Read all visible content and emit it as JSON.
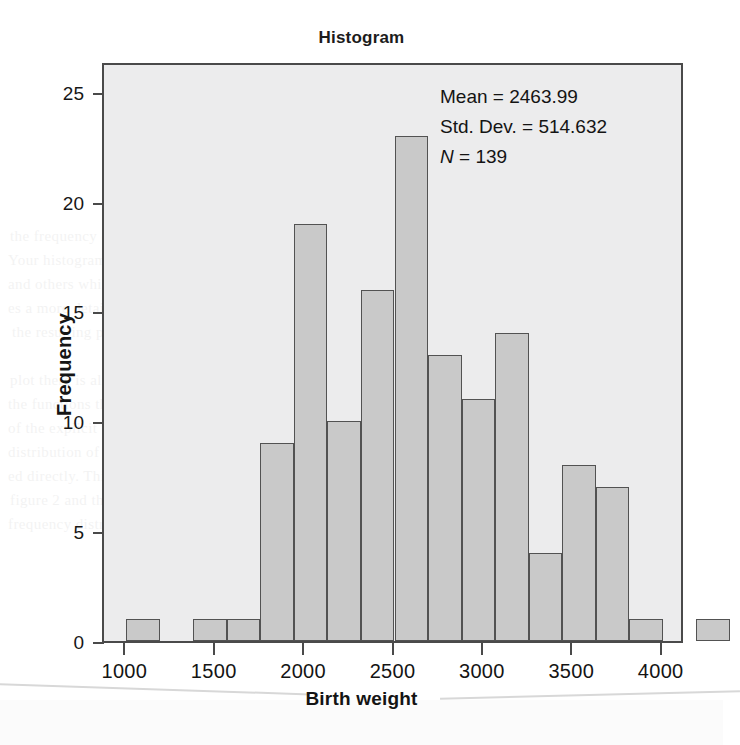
{
  "chart_data": {
    "type": "bar",
    "title": "Histogram",
    "xlabel": "Birth weight",
    "ylabel": "Frequency",
    "grid": false,
    "legend": null,
    "xlim": [
      875,
      4125
    ],
    "ylim": [
      0,
      26.4
    ],
    "xticks": [
      1000,
      1500,
      2000,
      2500,
      3000,
      3500,
      4000
    ],
    "yticks": [
      0,
      5,
      10,
      15,
      20,
      25
    ],
    "bin_width": 187.5,
    "bins": [
      {
        "x_left": 1000,
        "x_right": 1187.5,
        "value": 1
      },
      {
        "x_left": 1375,
        "x_right": 1562.5,
        "value": 1
      },
      {
        "x_left": 1562.5,
        "x_right": 1750,
        "value": 1
      },
      {
        "x_left": 1750,
        "x_right": 1937.5,
        "value": 9
      },
      {
        "x_left": 1937.5,
        "x_right": 2125,
        "value": 19
      },
      {
        "x_left": 2125,
        "x_right": 2312.5,
        "value": 10
      },
      {
        "x_left": 2312.5,
        "x_right": 2500,
        "value": 16
      },
      {
        "x_left": 2500,
        "x_right": 2687.5,
        "value": 23
      },
      {
        "x_left": 2687.5,
        "x_right": 2875,
        "value": 13
      },
      {
        "x_left": 2875,
        "x_right": 3062.5,
        "value": 11
      },
      {
        "x_left": 3062.5,
        "x_right": 3250,
        "value": 14
      },
      {
        "x_left": 3250,
        "x_right": 3437.5,
        "value": 4
      },
      {
        "x_left": 3437.5,
        "x_right": 3625,
        "value": 8
      },
      {
        "x_left": 3625,
        "x_right": 3812.5,
        "value": 7
      },
      {
        "x_left": 3812.5,
        "x_right": 4000,
        "value": 1
      },
      {
        "x_left": 4187.5,
        "x_right": 4375,
        "value": 1
      }
    ],
    "categories": [
      "1000",
      "1375",
      "1563",
      "1750",
      "1938",
      "2125",
      "2313",
      "2500",
      "2688",
      "2875",
      "3063",
      "3250",
      "3438",
      "3625",
      "3813",
      "4188"
    ],
    "values": [
      1,
      1,
      1,
      9,
      19,
      10,
      16,
      23,
      13,
      11,
      14,
      4,
      8,
      7,
      1,
      1
    ],
    "bar_fill": "#c9c9c9",
    "bar_stroke": "#525252",
    "plot_background": "#ececed"
  },
  "annotations": {
    "mean_label": "Mean = 2463.99",
    "stddev_label": "Std. Dev. = 514.632",
    "n_symbol": "N",
    "n_value": " = 139",
    "mean": 2463.99,
    "std_dev": 514.632,
    "n": 139
  },
  "bleed_text": {
    "lines": [
      {
        "text": "in data separately as result",
        "x": 200,
        "y": 78,
        "size": 15
      },
      {
        "text": "ing arms and plots",
        "x": 215,
        "y": 192,
        "size": 19,
        "head": true
      },
      {
        "text": "the frequency distribution of the",
        "x": 10,
        "y": 228,
        "size": 15
      },
      {
        "text": "Your histogram to see the distribution of",
        "x": 8,
        "y": 252,
        "size": 15
      },
      {
        "text": "and others which cannot be seen in the d",
        "x": 8,
        "y": 276,
        "size": 15
      },
      {
        "text": "es a more detailed, visual and enhanced f",
        "x": 8,
        "y": 300,
        "size": 15
      },
      {
        "text": "the resulting plot",
        "x": 12,
        "y": 324,
        "size": 15
      },
      {
        "text": "plot there is always a smoother",
        "x": 10,
        "y": 372,
        "size": 15
      },
      {
        "text": "the functions that the distribution clear",
        "x": 8,
        "y": 396,
        "size": 15
      },
      {
        "text": "of the explicit function to show the sample",
        "x": 8,
        "y": 420,
        "size": 15
      },
      {
        "text": "distribution of the sampling was normal",
        "x": 8,
        "y": 444,
        "size": 15
      },
      {
        "text": "ed directly. This result shows distributions fo",
        "x": 8,
        "y": 468,
        "size": 15
      },
      {
        "text": "figure 2 and the",
        "x": 10,
        "y": 492,
        "size": 15
      },
      {
        "text": "frequency distribution and the middle",
        "x": 8,
        "y": 516,
        "size": 15
      }
    ]
  }
}
